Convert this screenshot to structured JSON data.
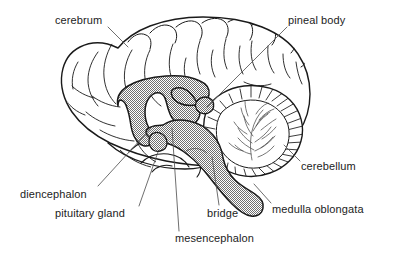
{
  "figure": {
    "type": "anatomical-diagram",
    "background_color": "#ffffff",
    "outline_color": "#1a1a1a",
    "shading_color": "#9a9a9a",
    "text_color": "#1c1c1c",
    "leader_line_color": "#555555"
  },
  "labels": [
    {
      "id": "cerebrum",
      "text": "cerebrum",
      "x": 55,
      "y": 14,
      "leader": {
        "x1": 108,
        "y1": 27,
        "x2": 128,
        "y2": 47
      }
    },
    {
      "id": "pineal-body",
      "text": "pineal body",
      "x": 288,
      "y": 14,
      "leader": {
        "x1": 287,
        "y1": 27,
        "x2": 207,
        "y2": 107
      }
    },
    {
      "id": "cerebellum",
      "text": "cerebellum",
      "x": 301,
      "y": 160,
      "leader": {
        "x1": 300,
        "y1": 161,
        "x2": 284,
        "y2": 145
      }
    },
    {
      "id": "medulla-oblongata",
      "text": "medulla oblongata",
      "x": 272,
      "y": 203,
      "leader": {
        "x1": 271,
        "y1": 203,
        "x2": 254,
        "y2": 184
      }
    },
    {
      "id": "bridge",
      "text": "bridge",
      "x": 207,
      "y": 207,
      "leader": {
        "x1": 219,
        "y1": 205,
        "x2": 212,
        "y2": 157
      }
    },
    {
      "id": "mesencephalon",
      "text": "mesencephalon",
      "x": 175,
      "y": 232,
      "leader": {
        "x1": 179,
        "y1": 231,
        "x2": 172,
        "y2": 128
      }
    },
    {
      "id": "pituitary-gland",
      "text": "pituitary gland",
      "x": 55,
      "y": 207,
      "leader": {
        "x1": 139,
        "y1": 206,
        "x2": 158,
        "y2": 152
      }
    },
    {
      "id": "diencephalon",
      "text": "diencephalon",
      "x": 20,
      "y": 188,
      "leader": {
        "x1": 98,
        "y1": 186,
        "x2": 152,
        "y2": 127
      }
    }
  ],
  "structures": [
    {
      "id": "cerebrum-outline",
      "name": "cerebrum",
      "shaded": false
    },
    {
      "id": "cerebellum",
      "name": "cerebellum",
      "shaded": false
    },
    {
      "id": "corpus-callosum",
      "name": "corpus callosum and diencephalon",
      "shaded": true
    },
    {
      "id": "brainstem",
      "name": "mesencephalon, bridge and medulla oblongata",
      "shaded": true
    },
    {
      "id": "pituitary",
      "name": "pituitary gland",
      "shaded": true
    }
  ]
}
